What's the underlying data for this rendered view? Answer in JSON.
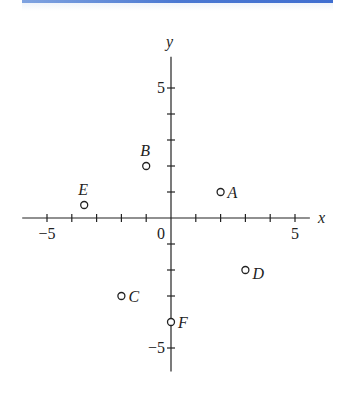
{
  "chart_data": {
    "type": "scatter",
    "title": "",
    "xlabel": "x",
    "ylabel": "y",
    "xlim": [
      -6,
      5.6
    ],
    "ylim": [
      -5.9,
      6.2
    ],
    "x_ticks": [
      -5,
      -4,
      -3,
      -2,
      -1,
      1,
      2,
      3,
      4,
      5
    ],
    "y_ticks": [
      -5,
      -4,
      -3,
      -2,
      -1,
      1,
      2,
      3,
      4,
      5
    ],
    "x_tick_labels": [
      {
        "value": -5,
        "text": "−5"
      },
      {
        "value": 0,
        "text": "0"
      },
      {
        "value": 5,
        "text": "5"
      }
    ],
    "y_tick_labels": [
      {
        "value": 5,
        "text": "5"
      },
      {
        "value": -5,
        "text": "−5"
      }
    ],
    "grid": false,
    "points": [
      {
        "label": "A",
        "x": 2,
        "y": 1,
        "label_side": "right"
      },
      {
        "label": "B",
        "x": -1,
        "y": 2,
        "label_side": "above"
      },
      {
        "label": "C",
        "x": -2,
        "y": -3,
        "label_side": "right"
      },
      {
        "label": "D",
        "x": 3,
        "y": -2,
        "label_side": "right"
      },
      {
        "label": "E",
        "x": -3.5,
        "y": 0.5,
        "label_side": "above"
      },
      {
        "label": "F",
        "x": 0,
        "y": -4,
        "label_side": "right"
      }
    ]
  },
  "colors": {
    "top_bar": "#4a78d2",
    "ink": "#222222"
  }
}
